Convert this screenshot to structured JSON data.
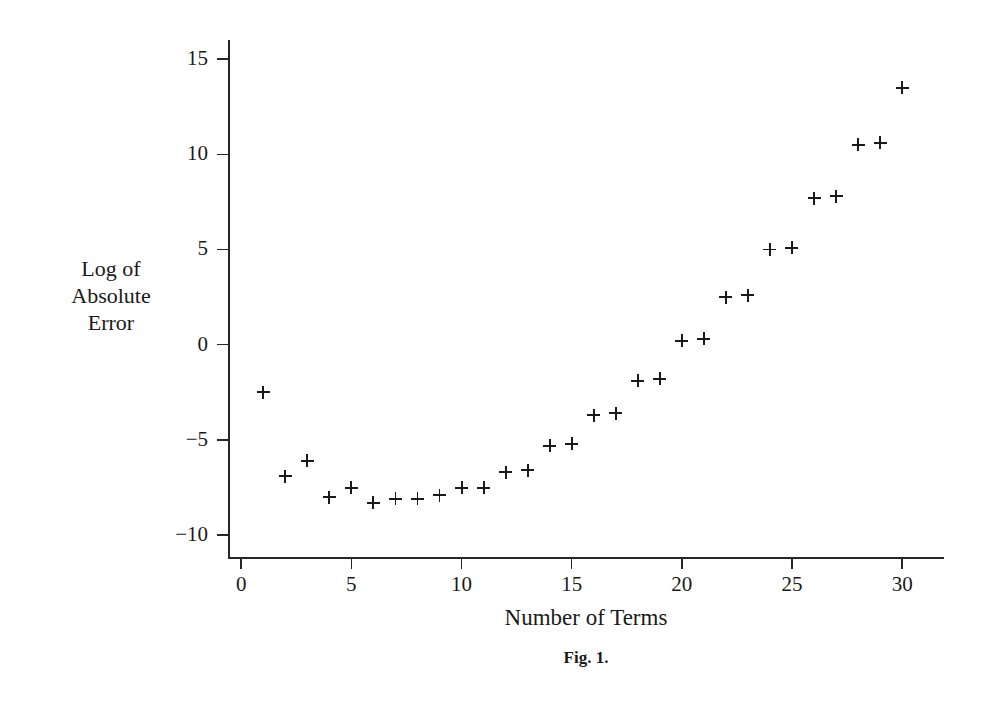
{
  "figure": {
    "caption": "Fig. 1.",
    "axis_color": "#262626",
    "marker_color": "#1a1a1a",
    "background": "#ffffff"
  },
  "labels": {
    "ylabel_line1": "Log of",
    "ylabel_line2": "Absolute",
    "ylabel_line3": "Error",
    "xlabel": "Number of Terms"
  },
  "chart_data": {
    "type": "scatter",
    "title": "",
    "subtitle": "",
    "xlabel": "Number of Terms",
    "ylabel": "Log of Absolute Error",
    "xlim": [
      -0.6,
      31.9
    ],
    "ylim": [
      -11.2,
      16.0
    ],
    "xticks": [
      0,
      5,
      10,
      15,
      20,
      25,
      30
    ],
    "xtick_labels": [
      "0",
      "5",
      "10",
      "15",
      "20",
      "25",
      "30"
    ],
    "yticks": [
      -10,
      -5,
      0,
      5,
      10,
      15
    ],
    "ytick_labels": [
      "−10",
      "−5",
      "0",
      "5",
      "10",
      "15"
    ],
    "grid": false,
    "legend": null,
    "marker": "plus",
    "series": [
      {
        "name": "Log of Absolute Error",
        "x": [
          1,
          2,
          3,
          4,
          5,
          6,
          7,
          8,
          9,
          10,
          11,
          12,
          13,
          14,
          15,
          16,
          17,
          18,
          19,
          20,
          21,
          22,
          23,
          24,
          25,
          26,
          27,
          28,
          29,
          30
        ],
        "y": [
          -2.5,
          -6.9,
          -6.1,
          -8.0,
          -7.5,
          -8.3,
          -8.1,
          -8.1,
          -7.9,
          -7.5,
          -7.5,
          -6.7,
          -6.6,
          -5.3,
          -5.2,
          -3.7,
          -3.6,
          -1.9,
          -1.8,
          0.2,
          0.3,
          2.5,
          2.6,
          5.0,
          5.1,
          7.7,
          7.8,
          10.5,
          10.6,
          13.5
        ]
      }
    ]
  }
}
